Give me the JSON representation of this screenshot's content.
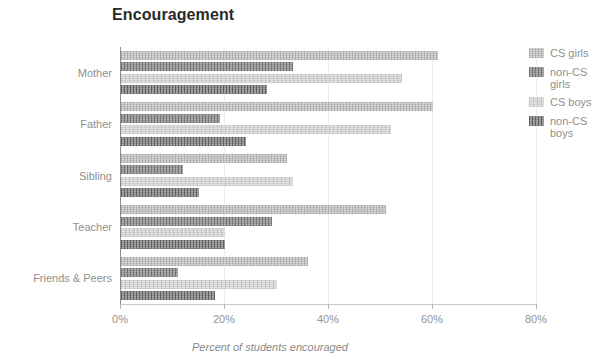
{
  "chart_data": {
    "type": "bar",
    "orientation": "horizontal",
    "title": "Encouragement",
    "xlabel": "Percent of students encouraged",
    "ylabel": "",
    "categories": [
      "Mother",
      "Father",
      "Sibling",
      "Teacher",
      "Friends & Peers"
    ],
    "series": [
      {
        "name": "CS girls",
        "color": "#d6d6d6",
        "values": [
          61,
          60,
          32,
          51,
          36
        ]
      },
      {
        "name": "non-CS girls",
        "color": "#9a9a9a",
        "values": [
          33,
          19,
          12,
          29,
          11
        ]
      },
      {
        "name": "CS boys",
        "color": "#e3e3e3",
        "values": [
          54,
          52,
          33,
          20,
          30
        ]
      },
      {
        "name": "non-CS boys",
        "color": "#8f8f8f",
        "values": [
          28,
          24,
          15,
          20,
          18
        ]
      }
    ],
    "xlim": [
      0,
      80
    ],
    "xticks": [
      0,
      20,
      40,
      60,
      80
    ],
    "xtick_labels": [
      "0%",
      "20%",
      "40%",
      "60%",
      "80%"
    ],
    "grid": true,
    "legend_position": "right"
  },
  "legend": {
    "entries": [
      {
        "label": "CS girls"
      },
      {
        "label": "non-CS\ngirls"
      },
      {
        "label": "CS boys"
      },
      {
        "label": "non-CS\nboys"
      }
    ]
  }
}
